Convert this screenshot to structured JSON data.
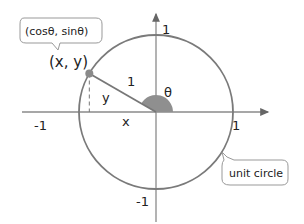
{
  "diagram": {
    "title": "Unit circle",
    "axes": {
      "x_ticks": [
        {
          "value": -1,
          "label": "-1"
        },
        {
          "value": 1,
          "label": "1"
        }
      ],
      "y_ticks": [
        {
          "value": 1,
          "label": "1"
        },
        {
          "value": -1,
          "label": "-1"
        }
      ]
    },
    "angle_deg": 150,
    "angle_label": "θ",
    "radius_label": "1",
    "x_label": "x",
    "y_label": "y",
    "point_label": "(x, y)",
    "point_callout": "(cosθ, sinθ)",
    "circle_callout": "unit circle",
    "colors": {
      "circle": "#7a7a7a",
      "axis": "#8a8a8a",
      "angle_fill": "#8f8f8f",
      "point": "#8a8a8a",
      "text": "#222222"
    }
  }
}
